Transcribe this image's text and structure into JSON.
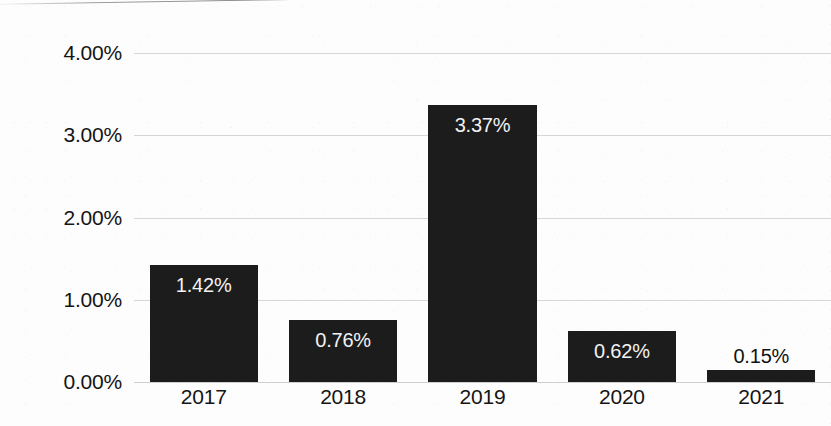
{
  "chart_data": {
    "type": "bar",
    "title": "",
    "subtitle": "",
    "xlabel": "",
    "ylabel": "",
    "categories": [
      "2017",
      "2018",
      "2019",
      "2020",
      "2021"
    ],
    "values": [
      1.42,
      0.76,
      3.37,
      0.62,
      0.15
    ],
    "value_labels": [
      "1.42%",
      "0.76%",
      "3.37%",
      "0.62%",
      "0.15%"
    ],
    "label_positions": [
      "inside",
      "inside",
      "inside",
      "inside",
      "outside"
    ],
    "ylim": [
      0,
      4
    ],
    "ytick_values": [
      0.0,
      1.0,
      2.0,
      3.0,
      4.0
    ],
    "ytick_labels": [
      "0.00%",
      "1.00%",
      "2.00%",
      "3.00%",
      "4.00%"
    ],
    "grid": true,
    "grid_axis": "y",
    "legend": false,
    "legend_position": "none",
    "series": [
      {
        "name": "",
        "values": [
          1.42,
          0.76,
          3.37,
          0.62,
          0.15
        ],
        "color": "#1c1c1c"
      }
    ],
    "colors": {
      "bar": "#1c1c1c",
      "gridline": "#d6d6d6",
      "axis_text": "#141414",
      "inside_label": "#f2f2f2",
      "outside_label": "#111111",
      "background": "#fdfdfd"
    }
  },
  "artifacts": {
    "scan_edge_label": "page-edge-line",
    "cropped_axis_title": ""
  }
}
